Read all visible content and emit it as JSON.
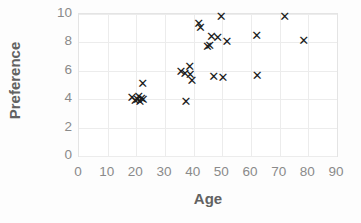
{
  "chart_data": {
    "type": "scatter",
    "title": "",
    "xlabel": "Age",
    "ylabel": "Preference",
    "xlim": [
      0,
      90
    ],
    "ylim": [
      0,
      10
    ],
    "xticks": [
      0,
      10,
      20,
      30,
      40,
      50,
      60,
      70,
      80,
      90
    ],
    "yticks": [
      0,
      2,
      4,
      6,
      8,
      10
    ],
    "grid": true,
    "legend": null,
    "marker": "x",
    "marker_color": "#1b1b1b",
    "points": [
      {
        "x": 18.5,
        "y": 4.1
      },
      {
        "x": 19.6,
        "y": 3.9
      },
      {
        "x": 20.4,
        "y": 4.0
      },
      {
        "x": 20.8,
        "y": 4.2
      },
      {
        "x": 21.3,
        "y": 3.85
      },
      {
        "x": 21.8,
        "y": 4.05
      },
      {
        "x": 22.2,
        "y": 5.1
      },
      {
        "x": 22.4,
        "y": 4.0
      },
      {
        "x": 35.6,
        "y": 5.95
      },
      {
        "x": 37.0,
        "y": 5.8
      },
      {
        "x": 37.3,
        "y": 3.85
      },
      {
        "x": 38.6,
        "y": 6.3
      },
      {
        "x": 38.8,
        "y": 5.75
      },
      {
        "x": 39.4,
        "y": 5.35
      },
      {
        "x": 41.8,
        "y": 9.3
      },
      {
        "x": 42.4,
        "y": 9.05
      },
      {
        "x": 44.8,
        "y": 7.7
      },
      {
        "x": 45.6,
        "y": 7.75
      },
      {
        "x": 46.2,
        "y": 8.45
      },
      {
        "x": 47.0,
        "y": 5.6
      },
      {
        "x": 48.4,
        "y": 8.35
      },
      {
        "x": 49.6,
        "y": 9.85
      },
      {
        "x": 50.2,
        "y": 5.5
      },
      {
        "x": 51.6,
        "y": 8.05
      },
      {
        "x": 62.0,
        "y": 8.5
      },
      {
        "x": 62.2,
        "y": 5.7
      },
      {
        "x": 71.8,
        "y": 9.8
      },
      {
        "x": 78.4,
        "y": 8.1
      }
    ]
  }
}
